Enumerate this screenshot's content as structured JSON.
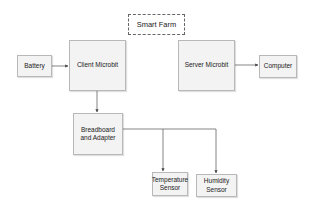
{
  "diagram": {
    "title": "Smart Farm",
    "nodes": [
      {
        "id": "battery",
        "label": "Battery"
      },
      {
        "id": "client",
        "label": "Client Microbit"
      },
      {
        "id": "server",
        "label": "Server Microbit"
      },
      {
        "id": "computer",
        "label": "Computer"
      },
      {
        "id": "breadboard",
        "label": "Breadboard and Adapter"
      },
      {
        "id": "temperature",
        "label": "Temperature Sensor"
      },
      {
        "id": "humidity",
        "label": "Humidity Sensor"
      }
    ],
    "edges": [
      {
        "from": "battery",
        "to": "client"
      },
      {
        "from": "server",
        "to": "computer"
      },
      {
        "from": "client",
        "to": "breadboard"
      },
      {
        "from": "breadboard",
        "to": "temperature"
      },
      {
        "from": "breadboard",
        "to": "humidity"
      }
    ],
    "colors": {
      "node_fill": "#f3f3f3",
      "node_border": "#b8b8b8",
      "edge": "#555555",
      "title_border": "#666666"
    }
  }
}
